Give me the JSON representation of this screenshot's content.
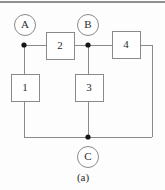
{
  "figure": {
    "caption": "(a)",
    "background_color": "#fdfdfd",
    "wire_color": "#8a8a8a",
    "node_color": "#151515",
    "label_color": "#2b2b2b",
    "top_rule_color": "#6b6b6b",
    "width": 165,
    "height": 190
  },
  "terminals": [
    {
      "id": "A",
      "label": "A",
      "cx": 25,
      "cy": 25,
      "r": 10.5,
      "node_x": 24,
      "node_y": 45
    },
    {
      "id": "B",
      "label": "B",
      "cx": 88,
      "cy": 25,
      "r": 10.5,
      "node_x": 88,
      "node_y": 45
    },
    {
      "id": "C",
      "label": "C",
      "cx": 88,
      "cy": 157,
      "r": 10.5,
      "node_x": 88,
      "node_y": 137
    }
  ],
  "components": [
    {
      "id": "1",
      "label": "1",
      "x": 11,
      "y": 74,
      "w": 28,
      "h": 27,
      "orientation": "vertical"
    },
    {
      "id": "2",
      "label": "2",
      "x": 46,
      "y": 32,
      "w": 28,
      "h": 27,
      "orientation": "horizontal"
    },
    {
      "id": "3",
      "label": "3",
      "x": 75,
      "y": 74,
      "w": 28,
      "h": 27,
      "orientation": "vertical"
    },
    {
      "id": "4",
      "label": "4",
      "x": 112,
      "y": 31,
      "w": 28,
      "h": 27,
      "orientation": "horizontal"
    }
  ],
  "wires": [
    {
      "id": "a-to-box2",
      "path": "M24,45 L46,45"
    },
    {
      "id": "box2-to-b",
      "path": "M74,45 L88,45"
    },
    {
      "id": "b-to-box4",
      "path": "M88,45 L112,45"
    },
    {
      "id": "box4-to-right-rail",
      "path": "M140,45 L152,45"
    },
    {
      "id": "right-rail-down",
      "path": "M152,45 L152,137"
    },
    {
      "id": "right-rail-to-c",
      "path": "M152,137 L88,137"
    },
    {
      "id": "c-to-left-rail",
      "path": "M88,137 L24,137"
    },
    {
      "id": "left-rail-up-to-box1",
      "path": "M24,137 L24,101"
    },
    {
      "id": "box1-up-to-a",
      "path": "M24,74 L24,45"
    },
    {
      "id": "b-down-to-box3",
      "path": "M88,45 L88,74"
    },
    {
      "id": "box3-down-to-c",
      "path": "M88,101 L88,137"
    }
  ],
  "nodes": [
    {
      "id": "node-a",
      "x": 24,
      "y": 45,
      "r": 2.6
    },
    {
      "id": "node-b",
      "x": 88,
      "y": 45,
      "r": 2.6
    },
    {
      "id": "node-c",
      "x": 88,
      "y": 137,
      "r": 2.6
    }
  ],
  "top_rule": {
    "x1": 0,
    "y1": 2,
    "x2": 165,
    "y2": 2
  }
}
